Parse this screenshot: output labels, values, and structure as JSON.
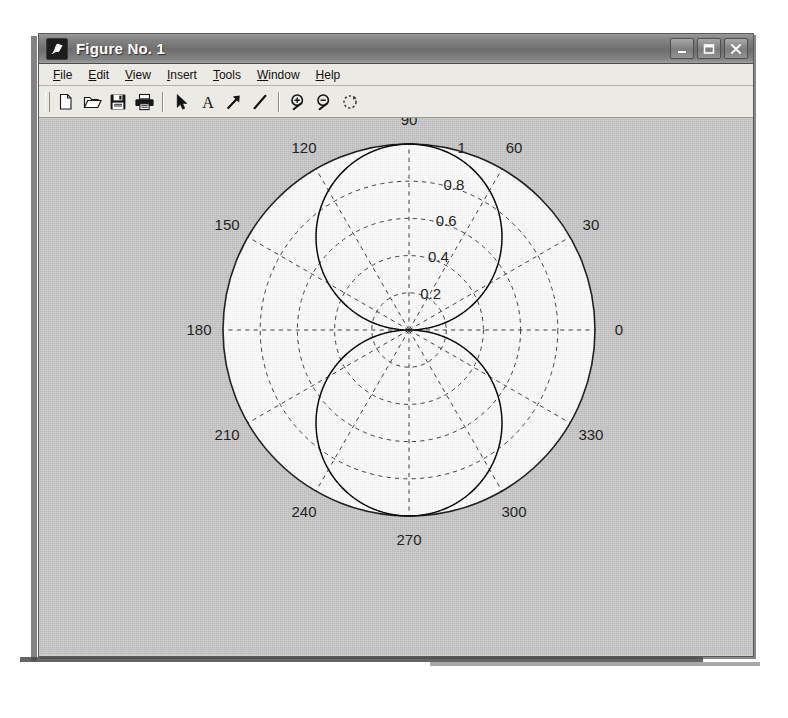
{
  "window": {
    "title": "Figure No. 1",
    "title_icon": "matlab-membrane-icon",
    "controls": [
      {
        "name": "minimize-button",
        "label": "_",
        "icon": "minimize-icon"
      },
      {
        "name": "maximize-button",
        "label": "□",
        "icon": "maximize-icon"
      },
      {
        "name": "close-button",
        "label": "X",
        "icon": "close-icon"
      }
    ],
    "frame_color": "#d4d0c8",
    "titlebar_color": "#7a7a7a"
  },
  "menu": {
    "items": [
      {
        "name": "menu-file",
        "label": "File",
        "mnemonic": "F"
      },
      {
        "name": "menu-edit",
        "label": "Edit",
        "mnemonic": "E"
      },
      {
        "name": "menu-view",
        "label": "View",
        "mnemonic": "V"
      },
      {
        "name": "menu-insert",
        "label": "Insert",
        "mnemonic": "I"
      },
      {
        "name": "menu-tools",
        "label": "Tools",
        "mnemonic": "T"
      },
      {
        "name": "menu-window",
        "label": "Window",
        "mnemonic": "W"
      },
      {
        "name": "menu-help",
        "label": "Help",
        "mnemonic": "H"
      }
    ]
  },
  "toolbar": {
    "buttons": [
      {
        "name": "new-figure-button",
        "icon": "new-document-icon",
        "tooltip": "New Figure"
      },
      {
        "name": "open-file-button",
        "icon": "open-folder-icon",
        "tooltip": "Open File"
      },
      {
        "name": "save-figure-button",
        "icon": "save-disk-icon",
        "tooltip": "Save Figure"
      },
      {
        "name": "print-figure-button",
        "icon": "printer-icon",
        "tooltip": "Print Figure"
      },
      {
        "name": "edit-plot-button",
        "icon": "arrow-pointer-icon",
        "tooltip": "Edit Plot"
      },
      {
        "name": "insert-text-button",
        "icon": "text-A-icon",
        "tooltip": "Insert Text"
      },
      {
        "name": "insert-arrow-button",
        "icon": "insert-arrow-icon",
        "tooltip": "Insert Arrow"
      },
      {
        "name": "insert-line-button",
        "icon": "insert-line-icon",
        "tooltip": "Insert Line"
      },
      {
        "name": "zoom-in-button",
        "icon": "zoom-in-icon",
        "tooltip": "Zoom In"
      },
      {
        "name": "zoom-out-button",
        "icon": "zoom-out-icon",
        "tooltip": "Zoom Out"
      },
      {
        "name": "rotate-3d-button",
        "icon": "rotate-3d-icon",
        "tooltip": "Rotate 3D"
      }
    ]
  },
  "chart_data": {
    "type": "line",
    "plot_kind": "polar",
    "title": "",
    "xlabel": "",
    "ylabel": "",
    "theta_unit": "degrees",
    "angle_ticks": [
      0,
      30,
      60,
      90,
      120,
      150,
      180,
      210,
      240,
      270,
      300,
      330
    ],
    "angle_tick_labels": [
      "0",
      "30",
      "60",
      "90",
      "120",
      "150",
      "180",
      "210",
      "240",
      "270",
      "300",
      "330"
    ],
    "radial_ticks": [
      0.2,
      0.4,
      0.6,
      0.8,
      1
    ],
    "radial_tick_labels": [
      "0.2",
      "0.4",
      "0.6",
      "0.8",
      "1"
    ],
    "rlim": [
      0,
      1
    ],
    "grid": true,
    "grid_style": "dashed",
    "legend": null,
    "background_color": "#c9c9c9",
    "axes_color": "#ffffff",
    "line_color": "#000000",
    "series": [
      {
        "name": "dipole-pattern",
        "expression": "r = |sin(theta)|",
        "theta": [
          0,
          10,
          20,
          30,
          40,
          50,
          60,
          70,
          80,
          90,
          100,
          110,
          120,
          130,
          140,
          150,
          160,
          170,
          180,
          190,
          200,
          210,
          220,
          230,
          240,
          250,
          260,
          270,
          280,
          290,
          300,
          310,
          320,
          330,
          340,
          350,
          360
        ],
        "r": [
          0.0,
          0.174,
          0.342,
          0.5,
          0.643,
          0.766,
          0.866,
          0.94,
          0.985,
          1.0,
          0.985,
          0.94,
          0.866,
          0.766,
          0.643,
          0.5,
          0.342,
          0.174,
          0.0,
          0.174,
          0.342,
          0.5,
          0.643,
          0.766,
          0.866,
          0.94,
          0.985,
          1.0,
          0.985,
          0.94,
          0.866,
          0.766,
          0.643,
          0.5,
          0.342,
          0.174,
          0.0
        ]
      }
    ]
  }
}
